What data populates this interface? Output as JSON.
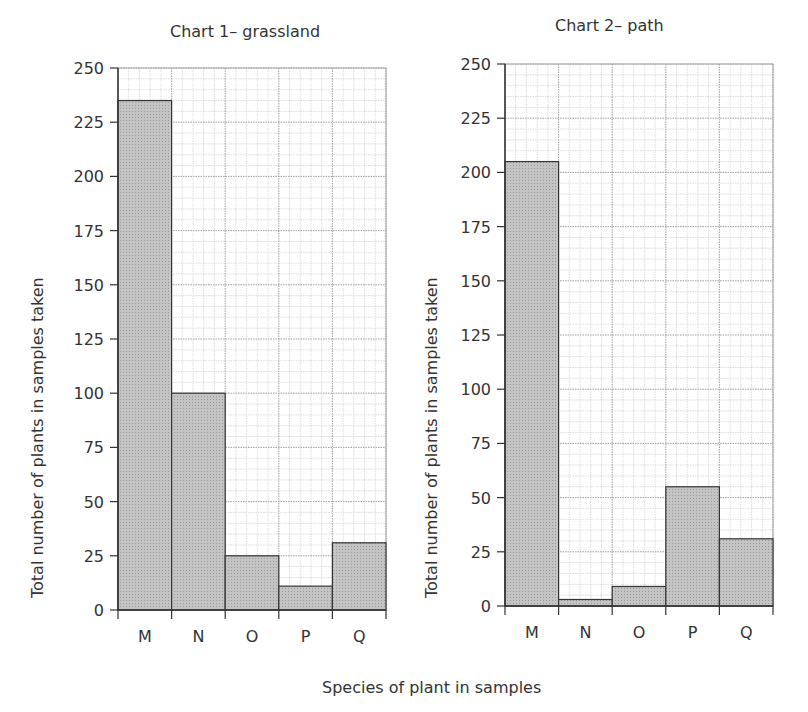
{
  "chart_data": [
    {
      "type": "bar",
      "title": "Chart 1– grassland",
      "categories": [
        "M",
        "N",
        "O",
        "P",
        "Q"
      ],
      "values": [
        235,
        100,
        25,
        11,
        31
      ],
      "xlabel": "Species of plant in samples",
      "ylabel": "Total number of plants in samples taken",
      "ylim": [
        0,
        250
      ],
      "yticks": [
        0,
        25,
        50,
        75,
        100,
        125,
        150,
        175,
        200,
        225,
        250
      ],
      "grid": true
    },
    {
      "type": "bar",
      "title": "Chart 2– path",
      "categories": [
        "M",
        "N",
        "O",
        "P",
        "Q"
      ],
      "values": [
        205,
        3,
        9,
        55,
        31
      ],
      "xlabel": "Species of plant in samples",
      "ylabel": "Total number of plants in samples taken",
      "ylim": [
        0,
        250
      ],
      "yticks": [
        0,
        25,
        50,
        75,
        100,
        125,
        150,
        175,
        200,
        225,
        250
      ],
      "grid": true
    }
  ],
  "shared_xlabel": "Species of plant in samples",
  "colors": {
    "bar": "#bdbdbd",
    "grid": "#aaaaaa",
    "axis": "#333333"
  }
}
